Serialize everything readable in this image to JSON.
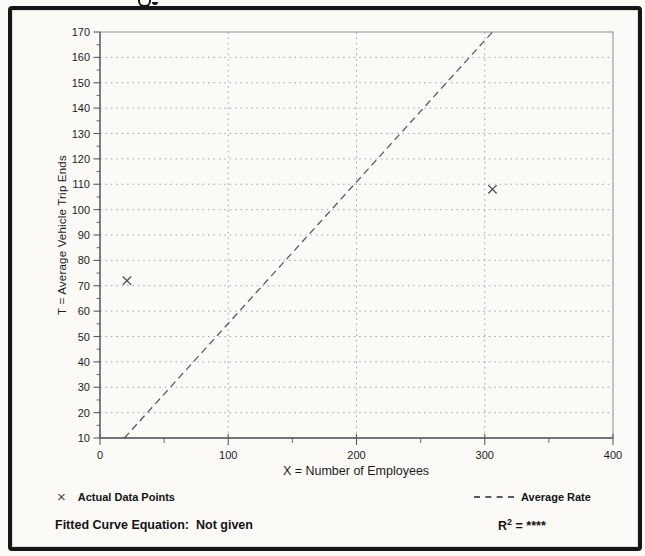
{
  "chart_data": {
    "type": "scatter",
    "title": "",
    "xlabel": "X = Number of Employees",
    "ylabel": "T = Average Vehicle Trip Ends",
    "xlim": [
      0,
      400
    ],
    "ylim": [
      10,
      170
    ],
    "x_major_step": 100,
    "x_minor_step": 50,
    "y_major_step": 10,
    "y_minor_step": 5,
    "grid": "dotted",
    "points": [
      {
        "x": 21,
        "y": 72
      },
      {
        "x": 306,
        "y": 108
      }
    ],
    "trend_line": {
      "name": "Average Rate",
      "x1": 19,
      "y1": 10,
      "x2": 306,
      "y2": 170,
      "style": "dashed"
    },
    "legend": [
      {
        "marker_glyph": "×",
        "label": "Actual Data Points"
      },
      {
        "marker_glyph": "dashed-line",
        "label": "Average Rate"
      }
    ],
    "colors": {
      "grid": "#a8a8a8",
      "axis": "#5a5a5a",
      "box": "#8c8c8c",
      "trend": "#565656",
      "marker": "#454545",
      "text": "#1c1c1c"
    }
  },
  "footer": {
    "equation_label": "Fitted Curve Equation:  Not given",
    "r_squared_base": "R",
    "r_squared_exp": "2",
    "r_squared_rest": " = ****"
  }
}
